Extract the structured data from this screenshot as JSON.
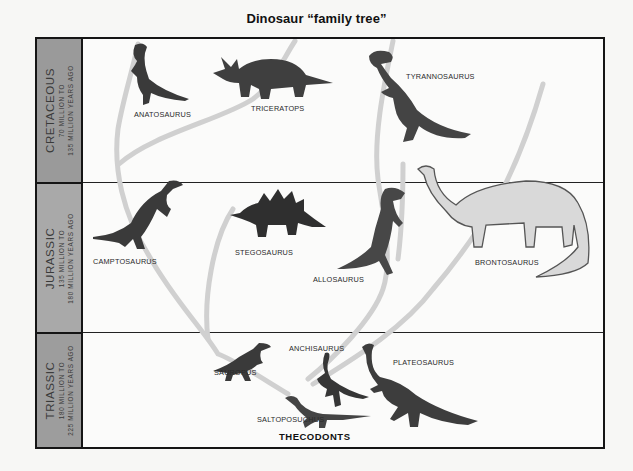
{
  "title": "Dinosaur “family tree”",
  "eras": [
    {
      "name": "CRETACEOUS",
      "line1": "70 MILLION TO",
      "line2": "135 MILLION YEARS AGO",
      "color": "#9a9a9a"
    },
    {
      "name": "JURASSIC",
      "line1": "135 MILLION TO",
      "line2": "180 MILLION YEARS AGO",
      "color": "#a9a9a9"
    },
    {
      "name": "TRIASSIC",
      "line1": "180 MILLION TO",
      "line2": "225 MILLION YEARS AGO",
      "color": "#9d9d9d"
    }
  ],
  "dinosaurs": {
    "anatosaurus": "ANATOSAURUS",
    "triceratops": "TRICERATOPS",
    "tyrannosaurus": "TYRANNOSAURUS",
    "camptosaurus": "CAMPTOSAURUS",
    "stegosaurus": "STEGOSAURUS",
    "allosaurus": "ALLOSAURUS",
    "brontosaurus": "BRONTOSAURUS",
    "sauropus": "SAUROPUS",
    "anchisaurus": "ANCHISAURUS",
    "plateosaurus": "PLATEOSAURUS",
    "saltoposuchus": "SALTOPOSUCHUS"
  },
  "root": "THECODONTS",
  "colors": {
    "frame": "#151515",
    "branch": "#cfcfcf",
    "dino": "#3c3c3c",
    "background": "#fbfbfa"
  }
}
